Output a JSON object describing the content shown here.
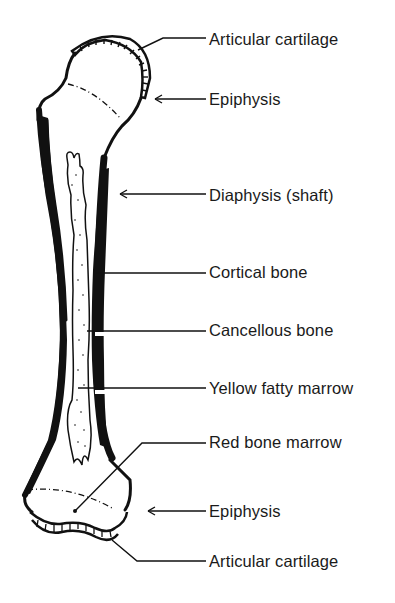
{
  "figure": {
    "labels": [
      {
        "id": "articular-cartilage-top",
        "text": "Articular cartilage",
        "top": 30
      },
      {
        "id": "epiphysis-top",
        "text": "Epiphysis",
        "top": 90
      },
      {
        "id": "diaphysis",
        "text": "Diaphysis (shaft)",
        "top": 186
      },
      {
        "id": "cortical-bone",
        "text": "Cortical bone",
        "top": 262
      },
      {
        "id": "cancellous-bone",
        "text": "Cancellous bone",
        "top": 320
      },
      {
        "id": "yellow-fatty-marrow",
        "text": "Yellow fatty marrow",
        "top": 378
      },
      {
        "id": "red-bone-marrow",
        "text": "Red bone marrow",
        "top": 432
      },
      {
        "id": "epiphysis-bottom",
        "text": "Epiphysis",
        "top": 502
      },
      {
        "id": "articular-cartilage-bottom",
        "text": "Articular cartilage",
        "top": 552
      }
    ],
    "caption": "",
    "colors": {
      "ink": "#111111",
      "background": "#ffffff"
    }
  }
}
